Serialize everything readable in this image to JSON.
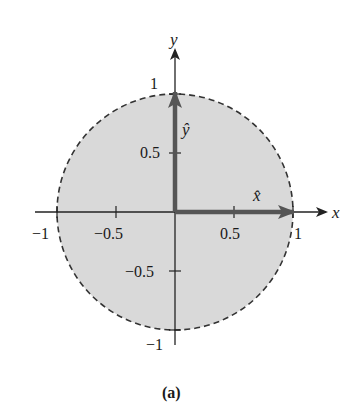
{
  "figure": {
    "caption": "(a)",
    "axes": {
      "x_label": "x",
      "y_label": "y",
      "x_ticks": [
        "−1",
        "−0.5",
        "0.5",
        "1"
      ],
      "y_ticks": [
        "1",
        "0.5",
        "−0.5",
        "−1"
      ]
    },
    "vectors": {
      "x_hat": {
        "label": "x̂",
        "from": [
          0,
          0
        ],
        "to": [
          1,
          0
        ]
      },
      "y_hat": {
        "label": "ŷ",
        "from": [
          0,
          0
        ],
        "to": [
          0,
          1
        ]
      }
    },
    "region": {
      "shape": "disk",
      "radius": 1,
      "boundary": "dashed",
      "fill_color": "#d9d9d9",
      "boundary_color": "#333333"
    },
    "colors": {
      "axis": "#222222",
      "vector": "#555555"
    }
  }
}
